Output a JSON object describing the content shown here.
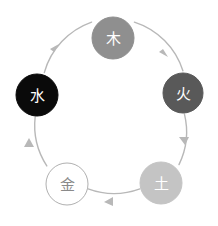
{
  "diagram": {
    "type": "cycle-diagram",
    "canvas": {
      "width": 218,
      "height": 226,
      "background": "#ffffff"
    },
    "layout": {
      "center_x": 110,
      "center_y": 111,
      "orbit_radius": 75,
      "direction": "clockwise"
    },
    "arc": {
      "color": "#b8b8b8",
      "stroke_width": 1.4
    },
    "nodes": [
      {
        "id": "wood",
        "glyph": "木",
        "cx": 113,
        "cy": 38,
        "r": 21,
        "fill": "#8f8f8f",
        "stroke": "#8f8f8f",
        "text_color": "#ffffff"
      },
      {
        "id": "fire",
        "glyph": "火",
        "cx": 183,
        "cy": 93,
        "r": 20,
        "fill": "#595959",
        "stroke": "#595959",
        "text_color": "#ffffff"
      },
      {
        "id": "earth",
        "glyph": "土",
        "cx": 161,
        "cy": 183,
        "r": 21,
        "fill": "#c4c4c4",
        "stroke": "#c4c4c4",
        "text_color": "#ffffff"
      },
      {
        "id": "metal",
        "glyph": "金",
        "cx": 67,
        "cy": 184,
        "r": 21,
        "fill": "#ffffff",
        "stroke": "#b0b0b0",
        "text_color": "#8a8a8a"
      },
      {
        "id": "water",
        "glyph": "水",
        "cx": 37,
        "cy": 95,
        "r": 21,
        "fill": "#0a0a0a",
        "stroke": "#0a0a0a",
        "text_color": "#ffffff"
      }
    ],
    "edges": [
      {
        "id": "water-to-wood",
        "from": "water",
        "to": "wood",
        "arrow_color": "#b8b8b8"
      },
      {
        "id": "wood-to-fire",
        "from": "wood",
        "to": "fire",
        "arrow_color": "#b8b8b8"
      },
      {
        "id": "fire-to-earth",
        "from": "fire",
        "to": "earth",
        "arrow_color": "#b8b8b8"
      },
      {
        "id": "earth-to-metal",
        "from": "earth",
        "to": "metal",
        "arrow_color": "#b8b8b8"
      },
      {
        "id": "metal-to-water",
        "from": "metal",
        "to": "water",
        "arrow_color": "#b8b8b8"
      }
    ]
  }
}
